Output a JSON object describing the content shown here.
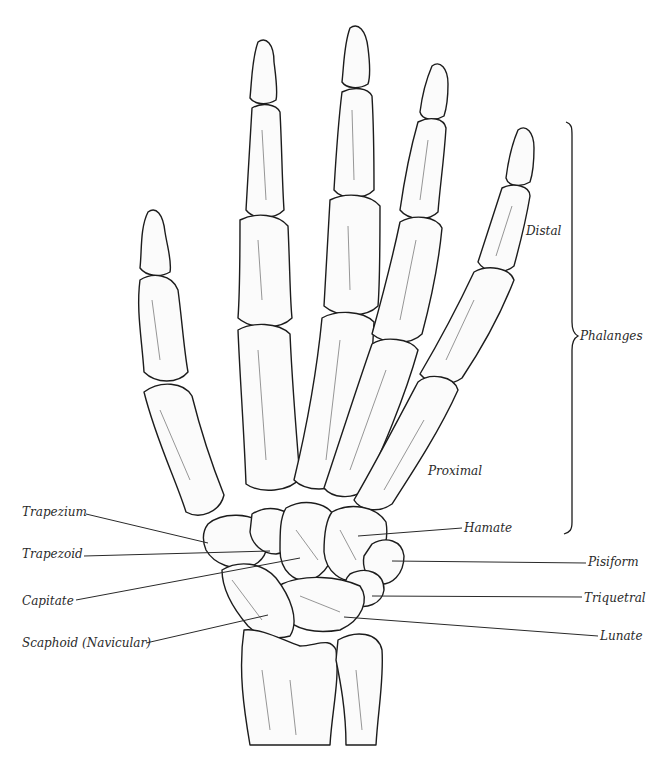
{
  "figure": {
    "colors": {
      "ink": "#1c1c1c",
      "paper": "#ffffff",
      "label_text": "#2a2a2a"
    }
  },
  "labels": {
    "phalanges": "Phalanges",
    "distal": "Distal",
    "proximal": "Proximal",
    "carpals_left": [
      {
        "id": "trapezium",
        "text": "Trapezium"
      },
      {
        "id": "trapezoid",
        "text": "Trapezoid"
      },
      {
        "id": "capitate",
        "text": "Capitate"
      },
      {
        "id": "scaphoid",
        "text": "Scaphoid (Navicular)"
      }
    ],
    "carpals_right": [
      {
        "id": "hamate",
        "text": "Hamate"
      },
      {
        "id": "pisiform",
        "text": "Pisiform"
      },
      {
        "id": "triquetral",
        "text": "Triquetral"
      },
      {
        "id": "lunate",
        "text": "Lunate"
      }
    ]
  }
}
